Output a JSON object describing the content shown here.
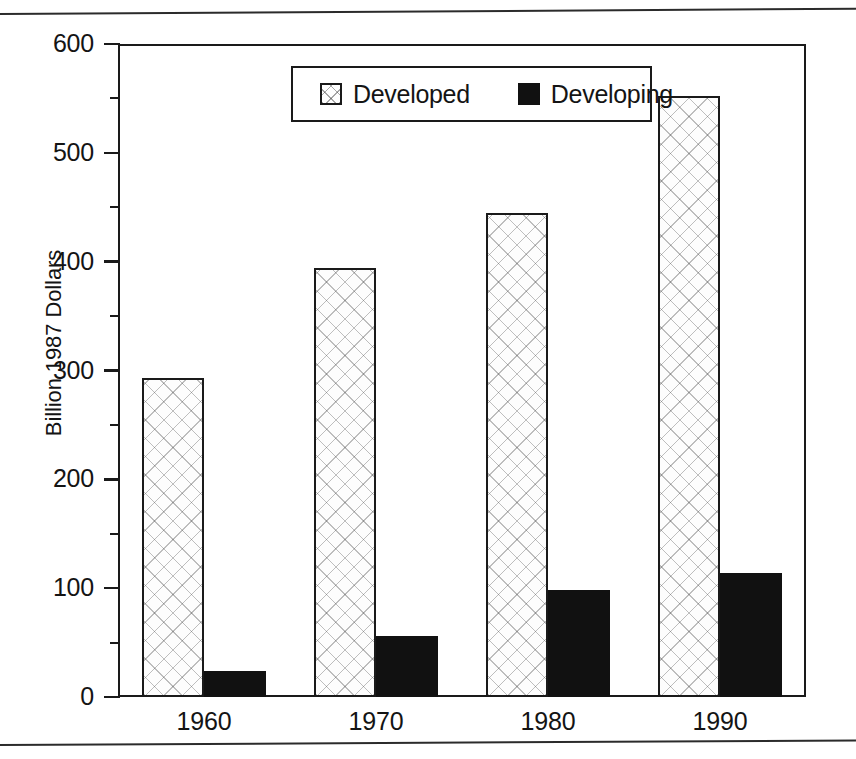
{
  "chart_data": {
    "type": "bar",
    "title": "",
    "xlabel": "",
    "ylabel": "Billion 1987 Dollars",
    "categories": [
      "1960",
      "1970",
      "1980",
      "1990"
    ],
    "series": [
      {
        "name": "Developed",
        "swatch": "hatched-square",
        "values": [
          293,
          394,
          445,
          552
        ]
      },
      {
        "name": "Developing",
        "swatch": "solid-black-square",
        "values": [
          24,
          56,
          98,
          114
        ]
      }
    ],
    "ylim": [
      0,
      600
    ],
    "yticks": [
      0,
      100,
      200,
      300,
      400,
      500,
      600
    ],
    "ytick_labels": [
      "0",
      "100",
      "200",
      "300",
      "400",
      "500",
      "600"
    ],
    "yminor_ticks": [
      50,
      150,
      250,
      350,
      450,
      550
    ],
    "grid": false,
    "legend_position": "top-center-inside",
    "colors": {
      "developed": "#fdfdfd",
      "developing": "#111111",
      "axis": "#1a1a1a"
    }
  },
  "legend": {
    "entries": [
      {
        "label": "Developed"
      },
      {
        "label": "Developing"
      }
    ]
  }
}
